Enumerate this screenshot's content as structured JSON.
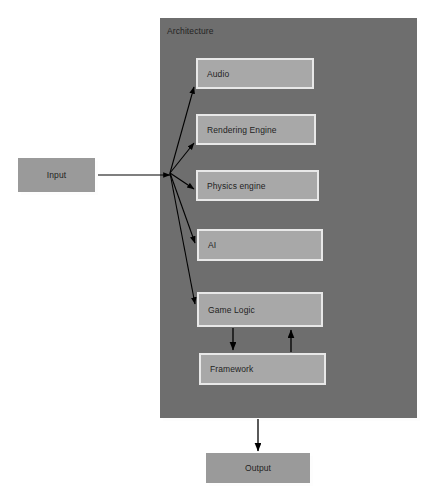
{
  "diagram": {
    "colors": {
      "page_background": "#ffffff",
      "container_fill": "#6e6e6e",
      "module_fill": "#a8a8a8",
      "module_border": "#e8e8e8",
      "io_fill": "#9a9a9a",
      "box_shadow": "#fdfdfd",
      "text": "#1f1f1f",
      "connector": "#000000"
    },
    "container": {
      "label": "Architecture"
    },
    "modules": [
      {
        "id": "audio",
        "label": "Audio"
      },
      {
        "id": "rendering",
        "label": "Rendering Engine"
      },
      {
        "id": "physics",
        "label": "Physics engine"
      },
      {
        "id": "ai",
        "label": "AI"
      },
      {
        "id": "gamelogic",
        "label": "Game Logic"
      },
      {
        "id": "framework",
        "label": "Framework"
      }
    ],
    "io": [
      {
        "id": "input",
        "label": "Input"
      },
      {
        "id": "output",
        "label": "Output"
      }
    ],
    "connectors": [
      {
        "id": "input-to-hub",
        "from": "Input",
        "to": "hub",
        "type": "line",
        "arrow": "end"
      },
      {
        "id": "hub-to-audio",
        "from": "hub",
        "to": "Audio",
        "type": "arrow",
        "arrow": "end"
      },
      {
        "id": "hub-to-rendering",
        "from": "hub",
        "to": "Rendering Engine",
        "type": "arrow",
        "arrow": "end"
      },
      {
        "id": "hub-to-physics",
        "from": "hub",
        "to": "Physics engine",
        "type": "arrow",
        "arrow": "end"
      },
      {
        "id": "hub-to-ai",
        "from": "hub",
        "to": "AI",
        "type": "arrow",
        "arrow": "end"
      },
      {
        "id": "hub-to-gamelogic",
        "from": "hub",
        "to": "Game Logic",
        "type": "arrow",
        "arrow": "end"
      },
      {
        "id": "gamelogic-to-framework",
        "from": "Game Logic",
        "to": "Framework",
        "type": "arrow",
        "arrow": "end"
      },
      {
        "id": "framework-to-gamelogic",
        "from": "Framework",
        "to": "Game Logic",
        "type": "arrow",
        "arrow": "end"
      },
      {
        "id": "architecture-to-output",
        "from": "Architecture",
        "to": "Output",
        "type": "arrow",
        "arrow": "end"
      }
    ]
  }
}
